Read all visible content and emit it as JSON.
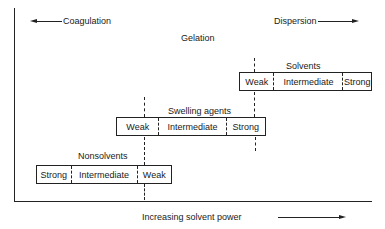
{
  "diagram": {
    "top_left_label": "Coagulation",
    "top_right_label": "Dispersion",
    "middle_label": "Gelation",
    "x_axis_label": "Increasing solvent power",
    "groups": [
      {
        "name": "Solvents",
        "cells": [
          "Weak",
          "Intermediate",
          "Strong"
        ]
      },
      {
        "name": "Swelling agents",
        "cells": [
          "Weak",
          "Intermediate",
          "Strong"
        ]
      },
      {
        "name": "Nonsolvents",
        "cells": [
          "Strong",
          "Intermediate",
          "Weak"
        ]
      }
    ]
  }
}
